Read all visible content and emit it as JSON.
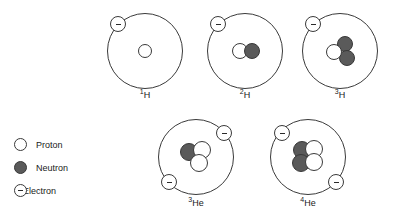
{
  "figure": {
    "particle_names": {
      "proton": "proton",
      "neutron": "neutron",
      "electron": "electron"
    },
    "colors": {
      "proton_fill": "#ffffff",
      "neutron_fill": "#5a5a5a",
      "electron_fill": "#ffffff",
      "stroke": "#3a3a3a",
      "background": "#ffffff"
    }
  },
  "atoms": [
    {
      "id": "hydrogen-1",
      "mass_number": "1",
      "symbol": "H",
      "protons": 1,
      "neutrons": 0,
      "electrons": 1,
      "orbit": {
        "cx": 145,
        "cy": 51,
        "r": 38
      },
      "nucleus": [
        {
          "type": "proton",
          "x": 145,
          "y": 51,
          "r": 7
        }
      ],
      "electron_positions": [
        {
          "x": 118,
          "y": 24,
          "r": 8
        }
      ],
      "caption": {
        "x": 145,
        "y": 88
      }
    },
    {
      "id": "hydrogen-2",
      "mass_number": "2",
      "symbol": "H",
      "protons": 1,
      "neutrons": 1,
      "electrons": 1,
      "orbit": {
        "cx": 245,
        "cy": 51,
        "r": 38
      },
      "nucleus": [
        {
          "type": "proton",
          "x": 240,
          "y": 51,
          "r": 8
        },
        {
          "type": "neutron",
          "x": 252,
          "y": 51,
          "r": 8
        }
      ],
      "electron_positions": [
        {
          "x": 218,
          "y": 24,
          "r": 8
        }
      ],
      "caption": {
        "x": 245,
        "y": 88
      }
    },
    {
      "id": "hydrogen-3",
      "mass_number": "3",
      "symbol": "H",
      "protons": 1,
      "neutrons": 2,
      "electrons": 1,
      "orbit": {
        "cx": 340,
        "cy": 51,
        "r": 38
      },
      "nucleus": [
        {
          "type": "neutron",
          "x": 345,
          "y": 44,
          "r": 8
        },
        {
          "type": "neutron",
          "x": 347,
          "y": 58,
          "r": 8
        },
        {
          "type": "proton",
          "x": 334,
          "y": 52,
          "r": 8
        }
      ],
      "electron_positions": [
        {
          "x": 313,
          "y": 24,
          "r": 8
        }
      ],
      "caption": {
        "x": 340,
        "y": 88
      }
    },
    {
      "id": "helium-3",
      "mass_number": "3",
      "symbol": "He",
      "protons": 2,
      "neutrons": 1,
      "electrons": 2,
      "orbit": {
        "cx": 196,
        "cy": 157,
        "r": 38
      },
      "nucleus": [
        {
          "type": "neutron",
          "x": 189,
          "y": 152,
          "r": 9
        },
        {
          "type": "proton",
          "x": 202,
          "y": 150,
          "r": 9
        },
        {
          "type": "proton",
          "x": 199,
          "y": 163,
          "r": 9
        }
      ],
      "electron_positions": [
        {
          "x": 224,
          "y": 133,
          "r": 8
        },
        {
          "x": 169,
          "y": 182,
          "r": 8
        }
      ],
      "caption": {
        "x": 196,
        "y": 196
      }
    },
    {
      "id": "helium-4",
      "mass_number": "4",
      "symbol": "He",
      "protons": 2,
      "neutrons": 2,
      "electrons": 2,
      "orbit": {
        "cx": 308,
        "cy": 157,
        "r": 38
      },
      "nucleus": [
        {
          "type": "neutron",
          "x": 302,
          "y": 150,
          "r": 9
        },
        {
          "type": "neutron",
          "x": 301,
          "y": 163,
          "r": 9
        },
        {
          "type": "proton",
          "x": 314,
          "y": 149,
          "r": 9
        },
        {
          "type": "proton",
          "x": 314,
          "y": 162,
          "r": 9
        }
      ],
      "electron_positions": [
        {
          "x": 282,
          "y": 133,
          "r": 8
        },
        {
          "x": 336,
          "y": 182,
          "r": 8
        }
      ],
      "caption": {
        "x": 308,
        "y": 196
      }
    }
  ],
  "legend": {
    "items": [
      {
        "key": "proton",
        "label": "Proton"
      },
      {
        "key": "neutron",
        "label": "Neutron"
      },
      {
        "key": "electron",
        "label": "Electron"
      }
    ]
  }
}
